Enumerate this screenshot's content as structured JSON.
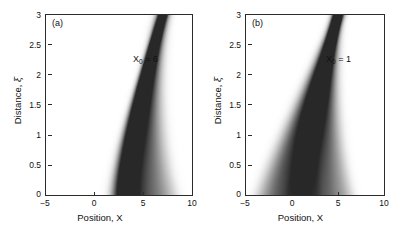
{
  "figure": {
    "background": "#ffffff",
    "axis_color": "#2b2b2b",
    "ink_color": "#303030"
  },
  "panels": [
    {
      "id": "a",
      "letter": "(a)",
      "annotation_symbol": "X",
      "annotation_sub": "0",
      "annotation_value": "= 6",
      "annotation_full": "X0 = 6"
    },
    {
      "id": "b",
      "letter": "(b)",
      "annotation_symbol": "X",
      "annotation_sub": "0",
      "annotation_value": "= 1",
      "annotation_full": "X0 = 1"
    }
  ],
  "axes": {
    "xlabel": "Position, X",
    "ylabel_prefix": "Distance, ",
    "ylabel_symbol": "ξ",
    "ylabel_full": "Distance, ξ",
    "xticks": [
      "−5",
      "0",
      "5",
      "10"
    ],
    "xtick_values": [
      -5,
      0,
      5,
      10
    ],
    "yticks": [
      "3",
      "2.5",
      "2",
      "1.5",
      "1",
      "0.5",
      "0"
    ],
    "ytick_values": [
      3,
      2.5,
      2,
      1.5,
      1,
      0.5,
      0
    ],
    "xlim": [
      -5,
      10
    ],
    "ylim": [
      0,
      3
    ]
  },
  "chart_data": {
    "type": "heatmap",
    "title": "",
    "xlabel": "Position, X",
    "ylabel": "Distance, ξ",
    "xlim": [
      -5,
      10
    ],
    "ylim": [
      0,
      3
    ],
    "grid": false,
    "legend": "none",
    "colormap": "grayscale-inverted",
    "panels": [
      {
        "id": "a",
        "label": "(a)",
        "parameter_name": "X0",
        "parameter_value": 6,
        "caustic": {
          "apex_position_x": 7.0,
          "apex_distance_xi": 3.0,
          "launch_center_x": 2.6,
          "launch_distance_xi": 0.0,
          "fan_direction": "right",
          "lobes": 5,
          "lobe_offsets_x": [
            0.0,
            0.95,
            2.0,
            3.25,
            4.6
          ],
          "lobe_intensity": [
            1.0,
            0.82,
            0.62,
            0.44,
            0.3
          ],
          "curvature_note": "beam bends to larger X with increasing xi; lobes converge near xi=3"
        }
      },
      {
        "id": "b",
        "label": "(b)",
        "parameter_name": "X0",
        "parameter_value": 1,
        "caustic": {
          "apex_position_x": 5.0,
          "apex_distance_xi": 3.0,
          "launch_center_x": 1.2,
          "launch_distance_xi": 0.0,
          "fan_direction": "both",
          "lobes": 5,
          "lobe_offsets_left_x": [
            0.0,
            -1.3,
            -2.6,
            -3.9
          ],
          "lobe_offsets_right_x": [
            0.0,
            1.3,
            2.7,
            4.2
          ],
          "lobe_intensity": [
            1.0,
            0.78,
            0.55,
            0.35
          ],
          "curvature_note": "symmetric fan from apex near xi=3 spreading in both directions toward xi=0"
        }
      }
    ]
  }
}
